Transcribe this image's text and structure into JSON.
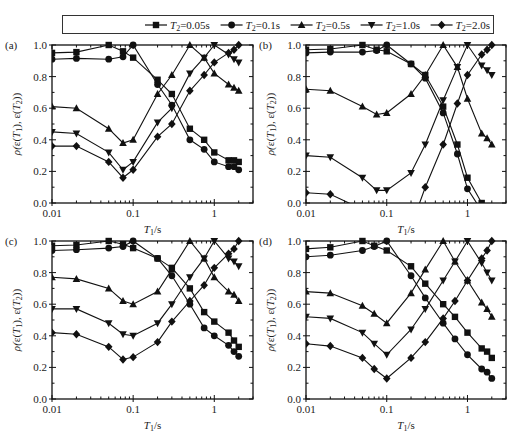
{
  "legend": {
    "entries": [
      {
        "name": "T2=0.05s",
        "var": "T",
        "sub": "2",
        "rest": "=0.05s",
        "marker": "square"
      },
      {
        "name": "T2=0.1s",
        "var": "T",
        "sub": "2",
        "rest": "=0.1s",
        "marker": "circle"
      },
      {
        "name": "T2=0.5s",
        "var": "T",
        "sub": "2",
        "rest": "=0.5s",
        "marker": "triangle-up"
      },
      {
        "name": "T2=1.0s",
        "var": "T",
        "sub": "2",
        "rest": "=1.0s",
        "marker": "triangle-down"
      },
      {
        "name": "T2=2.0s",
        "var": "T",
        "sub": "2",
        "rest": "=2.0s",
        "marker": "diamond"
      }
    ]
  },
  "chart_data": [
    {
      "type": "line",
      "panel": "(a)",
      "xscale": "log",
      "xlim": [
        0.01,
        3
      ],
      "ylim": [
        0,
        1.0
      ],
      "xticks": [
        "0.01",
        "0.1",
        "1"
      ],
      "yticks": [
        "0.0",
        "0.2",
        "0.4",
        "0.6",
        "0.8",
        "1.0"
      ],
      "xlabel": "T1/s",
      "ylabel": "ρ(ε(T1), ε(T2))",
      "x": [
        0.01,
        0.02,
        0.05,
        0.075,
        0.1,
        0.2,
        0.3,
        0.5,
        0.75,
        1.0,
        1.5,
        1.75,
        2.0
      ],
      "series": [
        {
          "name": "T2=0.05s",
          "marker": "square",
          "values": [
            0.95,
            0.955,
            1.0,
            0.96,
            0.92,
            0.78,
            0.69,
            0.47,
            0.4,
            0.32,
            0.27,
            0.27,
            0.26
          ]
        },
        {
          "name": "T2=0.1s",
          "marker": "circle",
          "values": [
            0.91,
            0.915,
            0.91,
            0.925,
            1.0,
            0.75,
            0.62,
            0.4,
            0.34,
            0.26,
            0.23,
            0.23,
            0.21
          ]
        },
        {
          "name": "T2=0.5s",
          "marker": "triangle-up",
          "values": [
            0.61,
            0.6,
            0.47,
            0.38,
            0.4,
            0.69,
            0.81,
            1.0,
            0.92,
            0.82,
            0.75,
            0.73,
            0.71
          ]
        },
        {
          "name": "T2=1.0s",
          "marker": "triangle-down",
          "values": [
            0.45,
            0.44,
            0.32,
            0.21,
            0.26,
            0.51,
            0.6,
            0.82,
            0.92,
            1.0,
            0.94,
            0.91,
            0.89
          ]
        },
        {
          "name": "T2=2.0s",
          "marker": "diamond",
          "values": [
            0.36,
            0.36,
            0.26,
            0.16,
            0.21,
            0.42,
            0.5,
            0.71,
            0.81,
            0.89,
            0.95,
            0.97,
            1.0
          ]
        }
      ]
    },
    {
      "type": "line",
      "panel": "(b)",
      "xscale": "log",
      "xlim": [
        0.01,
        3
      ],
      "ylim": [
        0,
        1.0
      ],
      "xticks": [
        "0.01",
        "0.1",
        "1"
      ],
      "yticks": [
        "0.0",
        "0.2",
        "0.4",
        "0.6",
        "0.8",
        "1.0"
      ],
      "xlabel": "T1/s",
      "ylabel": "ρ(ε(T1), ε(T2))",
      "x": [
        0.01,
        0.02,
        0.05,
        0.075,
        0.1,
        0.2,
        0.3,
        0.5,
        0.75,
        1.0,
        1.5,
        1.75,
        2.0
      ],
      "series": [
        {
          "name": "T2=0.05s",
          "marker": "square",
          "values": [
            0.97,
            0.975,
            1.0,
            0.97,
            0.96,
            0.88,
            0.81,
            0.61,
            0.37,
            0.16,
            0.0,
            null,
            null
          ]
        },
        {
          "name": "T2=0.1s",
          "marker": "circle",
          "values": [
            0.95,
            0.955,
            0.955,
            0.965,
            1.0,
            0.88,
            0.79,
            0.57,
            0.31,
            0.09,
            -0.05,
            null,
            null
          ]
        },
        {
          "name": "T2=0.5s",
          "marker": "triangle-up",
          "values": [
            0.72,
            0.71,
            0.61,
            0.56,
            0.57,
            0.69,
            0.81,
            1.0,
            0.86,
            0.66,
            0.44,
            0.41,
            0.37
          ]
        },
        {
          "name": "T2=1.0s",
          "marker": "triangle-down",
          "values": [
            0.3,
            0.29,
            0.16,
            0.08,
            0.08,
            0.19,
            0.37,
            0.65,
            0.86,
            1.0,
            0.87,
            0.84,
            0.81
          ]
        },
        {
          "name": "T2=2.0s",
          "marker": "diamond",
          "values": [
            0.065,
            0.055,
            -0.04,
            null,
            null,
            -0.15,
            0.1,
            0.37,
            0.63,
            0.81,
            0.94,
            0.97,
            1.0
          ]
        }
      ]
    },
    {
      "type": "line",
      "panel": "(c)",
      "xscale": "log",
      "xlim": [
        0.01,
        3
      ],
      "ylim": [
        0,
        1.0
      ],
      "xticks": [
        "0.01",
        "0.1",
        "1"
      ],
      "yticks": [
        "0.0",
        "0.2",
        "0.4",
        "0.6",
        "0.8",
        "1.0"
      ],
      "xlabel": "T1/s",
      "ylabel": "ρ(ε(T1), ε(T2))",
      "x": [
        0.01,
        0.02,
        0.05,
        0.075,
        0.1,
        0.2,
        0.3,
        0.5,
        0.75,
        1.0,
        1.5,
        1.75,
        2.0
      ],
      "series": [
        {
          "name": "T2=0.05s",
          "marker": "square",
          "values": [
            0.97,
            0.975,
            1.0,
            0.98,
            0.955,
            0.89,
            0.83,
            0.7,
            0.55,
            0.49,
            0.42,
            0.37,
            0.33
          ]
        },
        {
          "name": "T2=0.1s",
          "marker": "circle",
          "values": [
            0.94,
            0.945,
            0.955,
            0.965,
            1.0,
            0.89,
            0.78,
            0.6,
            0.45,
            0.4,
            0.34,
            0.3,
            0.27
          ]
        },
        {
          "name": "T2=0.5s",
          "marker": "triangle-up",
          "values": [
            0.77,
            0.76,
            0.7,
            0.62,
            0.6,
            0.68,
            0.82,
            1.0,
            0.89,
            0.77,
            0.68,
            0.66,
            0.62
          ]
        },
        {
          "name": "T2=1.0s",
          "marker": "triangle-down",
          "values": [
            0.57,
            0.57,
            0.48,
            0.41,
            0.4,
            0.48,
            0.6,
            0.77,
            0.89,
            1.0,
            0.89,
            0.87,
            0.84
          ]
        },
        {
          "name": "T2=2.0s",
          "marker": "diamond",
          "values": [
            0.42,
            0.41,
            0.33,
            0.25,
            0.265,
            0.36,
            0.49,
            0.62,
            0.72,
            0.83,
            0.92,
            0.95,
            1.0
          ]
        }
      ]
    },
    {
      "type": "line",
      "panel": "(d)",
      "xscale": "log",
      "xlim": [
        0.01,
        3
      ],
      "ylim": [
        0,
        1.0
      ],
      "xticks": [
        "0.01",
        "0.1",
        "1"
      ],
      "yticks": [
        "0.0",
        "0.2",
        "0.4",
        "0.6",
        "0.8",
        "1.0"
      ],
      "xlabel": "T1/s",
      "ylabel": "ρ(ε(T1), ε(T2))",
      "x": [
        0.01,
        0.02,
        0.05,
        0.07,
        0.1,
        0.2,
        0.3,
        0.5,
        0.7,
        1.0,
        1.5,
        1.75,
        2.0
      ],
      "series": [
        {
          "name": "T2=0.05s",
          "marker": "square",
          "values": [
            0.95,
            0.96,
            1.0,
            0.97,
            0.94,
            0.84,
            0.73,
            0.6,
            0.52,
            0.42,
            0.32,
            0.3,
            0.26
          ]
        },
        {
          "name": "T2=0.1s",
          "marker": "circle",
          "values": [
            0.9,
            0.91,
            0.94,
            0.965,
            1.0,
            0.78,
            0.64,
            0.48,
            0.38,
            0.28,
            0.19,
            0.17,
            0.13
          ]
        },
        {
          "name": "T2=0.5s",
          "marker": "triangle-up",
          "values": [
            0.68,
            0.67,
            0.59,
            0.54,
            0.48,
            0.67,
            0.82,
            1.0,
            0.87,
            0.75,
            0.61,
            0.57,
            0.52
          ]
        },
        {
          "name": "T2=1.0s",
          "marker": "triangle-down",
          "values": [
            0.52,
            0.51,
            0.42,
            0.35,
            0.28,
            0.44,
            0.57,
            0.75,
            0.87,
            1.0,
            0.86,
            0.8,
            0.75
          ]
        },
        {
          "name": "T2=2.0s",
          "marker": "diamond",
          "values": [
            0.35,
            0.335,
            0.26,
            0.19,
            0.13,
            0.26,
            0.36,
            0.51,
            0.62,
            0.75,
            0.89,
            0.94,
            1.0
          ]
        }
      ]
    }
  ]
}
